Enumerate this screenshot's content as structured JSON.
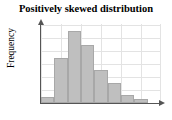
{
  "chart_data": {
    "type": "bar",
    "title": "Positively skewed distribution",
    "xlabel": "",
    "ylabel": "Frequency",
    "categories": [
      "1",
      "2",
      "3",
      "4",
      "5",
      "6",
      "7",
      "8",
      "9"
    ],
    "values": [
      6,
      45,
      72,
      58,
      33,
      20,
      8,
      4,
      0
    ],
    "ylim": [
      0,
      79
    ],
    "grid": true,
    "legend": null,
    "bar_color": "#bfbfbf",
    "bar_border_color": "#a8a8a8",
    "axis_color": "#555555",
    "grid_color": "#e3e3e3",
    "background": "#ffffff",
    "gridlines_horizontal": [
      0,
      13,
      26,
      39,
      52,
      65,
      78
    ],
    "gridlines_vertical": [
      0,
      20,
      40,
      60,
      80,
      100,
      119
    ],
    "annotations": []
  },
  "axes": {
    "y_arrow": "up-arrow-icon",
    "x_arrow": "right-arrow-icon"
  }
}
